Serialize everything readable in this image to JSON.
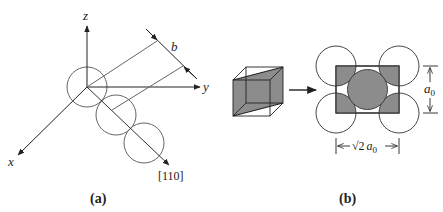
{
  "panel_a": {
    "caption": "(a)",
    "axes": {
      "x_label": "x",
      "y_label": "y",
      "z_label": "z"
    },
    "direction_label": "[110]",
    "spacing_label": "b",
    "atom_count": 3
  },
  "panel_b": {
    "caption": "(b)",
    "height_label": "a",
    "height_subscript": "0",
    "width_label_root": "√2",
    "width_label_var": "a",
    "width_subscript": "0",
    "plane_fill_color": "#8c8c8c",
    "corner_atom_count": 4,
    "center_atom_count": 1
  },
  "colors": {
    "line": "#222222",
    "circle_stroke": "#555555",
    "shade": "#8c8c8c"
  }
}
